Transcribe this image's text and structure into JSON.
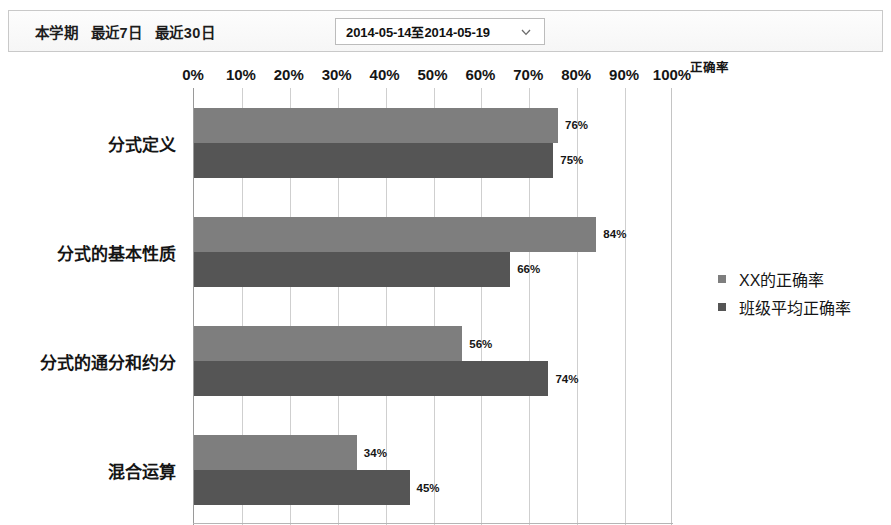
{
  "toolbar": {
    "tabs": [
      {
        "label": "本学期",
        "name": "tab-current-term"
      },
      {
        "label": "最近7日",
        "name": "tab-last-7-days"
      },
      {
        "label": "最近30日",
        "name": "tab-last-30-days"
      }
    ],
    "date_range": {
      "value": "2014-05-14至2014-05-19",
      "caret_icon": "chevron-down-icon"
    }
  },
  "chart_data": {
    "type": "bar",
    "orientation": "horizontal",
    "title": "",
    "xlabel": "正确率",
    "ylabel": "",
    "xlim": [
      0,
      100
    ],
    "x_unit": "%",
    "grid": true,
    "legend_position": "right",
    "categories": [
      "分式定义",
      "分式的基本性质",
      "分式的通分和约分",
      "混合运算"
    ],
    "tick_labels": [
      "0%",
      "10%",
      "20%",
      "30%",
      "40%",
      "50%",
      "60%",
      "70%",
      "80%",
      "90%",
      "100%"
    ],
    "tick_values": [
      0,
      10,
      20,
      30,
      40,
      50,
      60,
      70,
      80,
      90,
      100
    ],
    "series": [
      {
        "name": "XX的正确率",
        "color": "#7e7e7e",
        "values": [
          76,
          84,
          56,
          34
        ],
        "value_labels": [
          "76%",
          "84%",
          "56%",
          "34%"
        ]
      },
      {
        "name": "班级平均正确率",
        "color": "#555555",
        "values": [
          75,
          66,
          74,
          45
        ],
        "value_labels": [
          "75%",
          "66%",
          "74%",
          "45%"
        ]
      }
    ]
  }
}
